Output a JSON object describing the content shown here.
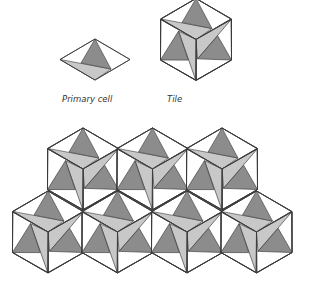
{
  "figure": {
    "labels": {
      "primary_cell": "Primary cell",
      "tile": "Tile"
    },
    "colors": {
      "background": "#ffffff",
      "outline": "#3a3a3a",
      "dark_triangle": "#8c8c8c",
      "light_triangle": "#c8c8c8"
    },
    "primary_cell": {
      "shape": "rhombus",
      "center": [
        95,
        59.5
      ],
      "half_width": 35,
      "half_height": 20.5,
      "dark_triangle": [
        [
          0,
          -20.5
        ],
        [
          -14,
          3.5
        ],
        [
          16,
          9.5
        ]
      ],
      "light_triangle": [
        [
          -35,
          0
        ],
        [
          16,
          9.5
        ],
        [
          0,
          20.5
        ]
      ]
    },
    "tile": {
      "shape": "hexagon",
      "center": [
        196,
        39.5
      ],
      "cells": 3,
      "rotation_deg": 120
    },
    "tiling": {
      "rows": [
        {
          "count": 3,
          "centers_x": [
            83,
            152.5,
            222
          ],
          "center_y": 169
        },
        {
          "count": 4,
          "centers_x": [
            48,
            117.5,
            187,
            256.5
          ],
          "center_y": 232
        }
      ]
    }
  }
}
